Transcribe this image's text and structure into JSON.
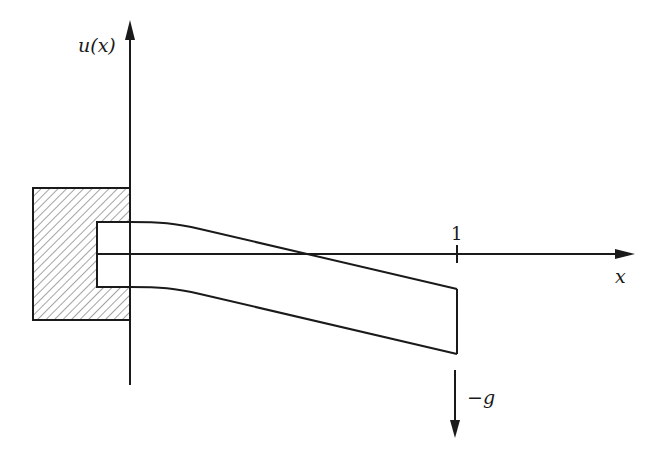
{
  "diagram": {
    "labels": {
      "y_axis": "u(x)",
      "x_axis": "x",
      "tick_one": "1",
      "load": "−g"
    },
    "colors": {
      "stroke": "#1a1a1a",
      "background": "#ffffff",
      "hatch": "#555555"
    },
    "elements": [
      {
        "name": "clamped-wall",
        "type": "hatched-rectangle"
      },
      {
        "name": "beam-top-edge",
        "type": "curve"
      },
      {
        "name": "beam-bottom-edge",
        "type": "curve"
      },
      {
        "name": "beam-free-end",
        "type": "line"
      },
      {
        "name": "load-arrow",
        "type": "arrow",
        "direction": "down"
      }
    ]
  }
}
